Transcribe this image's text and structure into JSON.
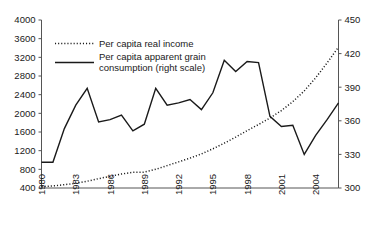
{
  "chart_data": {
    "type": "line",
    "title": "",
    "subtitle": "",
    "xlabel": "",
    "ylabel": "",
    "grid": false,
    "legend_position": "top-left",
    "x": [
      1980,
      1981,
      1982,
      1983,
      1984,
      1985,
      1986,
      1987,
      1988,
      1989,
      1990,
      1991,
      1992,
      1993,
      1994,
      1995,
      1996,
      1997,
      1998,
      1999,
      2000,
      2001,
      2002,
      2003,
      2004,
      2005,
      2006
    ],
    "x_tick_labels": [
      "1980",
      "1983",
      "1986",
      "1989",
      "1992",
      "1995",
      "1998",
      "2001",
      "2004"
    ],
    "x_ticks": [
      1980,
      1983,
      1986,
      1989,
      1992,
      1995,
      1998,
      2001,
      2004
    ],
    "xlim": [
      1980,
      2006
    ],
    "left_axis": {
      "label": "",
      "ylim": [
        400,
        4000
      ],
      "tick_step": 400,
      "tick_labels": [
        "4000",
        "3600",
        "3200",
        "2800",
        "2400",
        "2000",
        "1600",
        "1200",
        "800",
        "400"
      ],
      "ticks": [
        4000,
        3600,
        3200,
        2800,
        2400,
        2000,
        1600,
        1200,
        800,
        400
      ]
    },
    "right_axis": {
      "label": "",
      "ylim": [
        300,
        450
      ],
      "tick_step": 30,
      "tick_labels": [
        "450",
        "420",
        "390",
        "360",
        "330",
        "300"
      ],
      "ticks": [
        450,
        420,
        390,
        360,
        330,
        300
      ]
    },
    "series": [
      {
        "name": "Per capita real income",
        "axis": "left",
        "style": "dotted",
        "color": "#1a1a1a",
        "values": [
          430,
          445,
          470,
          500,
          545,
          600,
          650,
          700,
          735,
          740,
          800,
          880,
          960,
          1040,
          1130,
          1240,
          1360,
          1490,
          1630,
          1760,
          1900,
          2060,
          2250,
          2480,
          2760,
          3080,
          3420
        ]
      },
      {
        "name": "Per capita apparent grain consumption (right scale)",
        "axis": "right",
        "style": "solid",
        "color": "#1a1a1a",
        "values": [
          323,
          323,
          353,
          374,
          389,
          359,
          361,
          365,
          351,
          357,
          389,
          374,
          376,
          379,
          370,
          385,
          414,
          404,
          413,
          412,
          364,
          355,
          356,
          330,
          347,
          361,
          376
        ]
      }
    ]
  },
  "legend": {
    "entries": [
      {
        "label": "Per capita real income",
        "style": "dotted"
      },
      {
        "label_line1": "Per capita apparent grain",
        "label_line2": "consumption (right scale)",
        "style": "solid"
      }
    ]
  }
}
